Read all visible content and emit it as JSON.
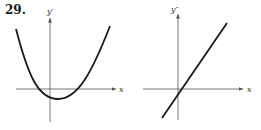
{
  "problem_number": "29.",
  "panels": [
    {
      "id": "first-derivative",
      "y_label": "y′",
      "x_label": "x",
      "curve": "upward-opening parabola, vertex slightly right of y-axis and below x-axis"
    },
    {
      "id": "second-derivative",
      "y_label": "y″",
      "x_label": "x",
      "curve": "increasing straight line crossing x-axis just right of origin"
    }
  ],
  "colors": {
    "ink": "#1a1a1a",
    "axis": "#555555",
    "background": "#ffffff"
  }
}
